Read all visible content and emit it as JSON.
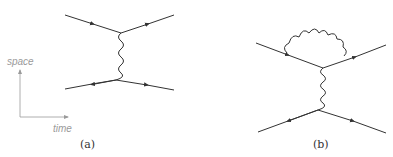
{
  "figure": {
    "panels": [
      {
        "id": "a",
        "caption": "(a)",
        "description": "Tree-level single photon exchange between two fermion lines"
      },
      {
        "id": "b",
        "caption": "(b)",
        "description": "Photon exchange with vertex correction loop on upper fermion line"
      }
    ],
    "axes": {
      "vertical_label": "space",
      "horizontal_label": "time"
    },
    "colors": {
      "line": "#333333",
      "axis": "#9a9a9a"
    }
  }
}
